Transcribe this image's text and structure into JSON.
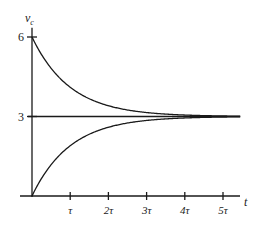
{
  "chart_data": {
    "type": "line",
    "title": "",
    "xlabel": "t",
    "ylabel": "v",
    "ylabel_subscript": "c",
    "xlim": [
      0,
      5.5
    ],
    "ylim": [
      0,
      6
    ],
    "grid": false,
    "legend": null,
    "x_ticks": [
      {
        "value": 1,
        "label": "τ"
      },
      {
        "value": 2,
        "label": "2τ"
      },
      {
        "value": 3,
        "label": "3τ"
      },
      {
        "value": 4,
        "label": "4τ"
      },
      {
        "value": 5,
        "label": "5τ"
      }
    ],
    "y_ticks": [
      {
        "value": 6,
        "label": "6"
      },
      {
        "value": 3,
        "label": "3"
      }
    ],
    "x": [
      0,
      0.5,
      1,
      1.5,
      2,
      2.5,
      3,
      3.5,
      4,
      4.5,
      5,
      5.5
    ],
    "series": [
      {
        "name": "decay from 6",
        "formula": "3 + 3e^(-t/τ)",
        "values": [
          6.0,
          4.82,
          4.1,
          3.67,
          3.41,
          3.25,
          3.15,
          3.09,
          3.05,
          3.03,
          3.02,
          3.01
        ]
      },
      {
        "name": "rise from 0",
        "formula": "3 - 3e^(-t/τ)",
        "values": [
          0.0,
          1.18,
          1.9,
          2.33,
          2.59,
          2.75,
          2.85,
          2.91,
          2.95,
          2.97,
          2.98,
          2.99
        ]
      },
      {
        "name": "steady state",
        "formula": "3",
        "values": [
          3,
          3,
          3,
          3,
          3,
          3,
          3,
          3,
          3,
          3,
          3,
          3
        ]
      }
    ]
  }
}
